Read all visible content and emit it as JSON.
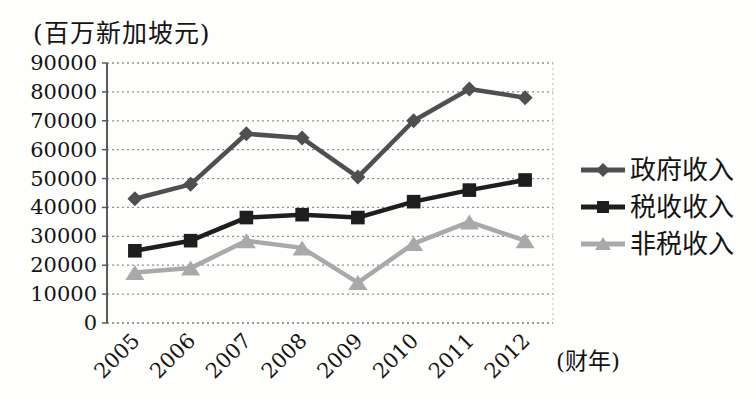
{
  "figure": {
    "unit_label": "(百万新加坡元)",
    "fiscal_year_label": "(财年)"
  },
  "chart_data": {
    "type": "line",
    "title": "",
    "ylabel": "(百万新加坡元)",
    "xlabel": "(财年)",
    "categories": [
      "2005",
      "2006",
      "2007",
      "2008",
      "2009",
      "2010",
      "2011",
      "2012"
    ],
    "series": [
      {
        "id": "government-revenue",
        "name": "政府收入",
        "marker": "diamond",
        "color": "#4f4f4f",
        "values": [
          43000,
          48000,
          65500,
          64000,
          50500,
          70000,
          81000,
          78000
        ]
      },
      {
        "id": "tax-revenue",
        "name": "税收收入",
        "marker": "square",
        "color": "#1e1e1e",
        "values": [
          25000,
          28500,
          36500,
          37500,
          36500,
          42000,
          46000,
          49500
        ]
      },
      {
        "id": "non-tax-revenue",
        "name": "非税收入",
        "marker": "triangle",
        "color": "#a9a9a9",
        "values": [
          17500,
          19000,
          28500,
          26000,
          14000,
          27500,
          35000,
          28500
        ]
      }
    ],
    "ylim": [
      0,
      90000
    ],
    "ytick_step": 10000,
    "yticks": [
      0,
      10000,
      20000,
      30000,
      40000,
      50000,
      60000,
      70000,
      80000,
      90000
    ],
    "grid": "horizontal-dotted",
    "legend_position": "right"
  },
  "colors": {
    "background": "#fefefc",
    "text": "#141414",
    "gridline": "#8f8f8f",
    "axis": "#5a5a5a"
  }
}
